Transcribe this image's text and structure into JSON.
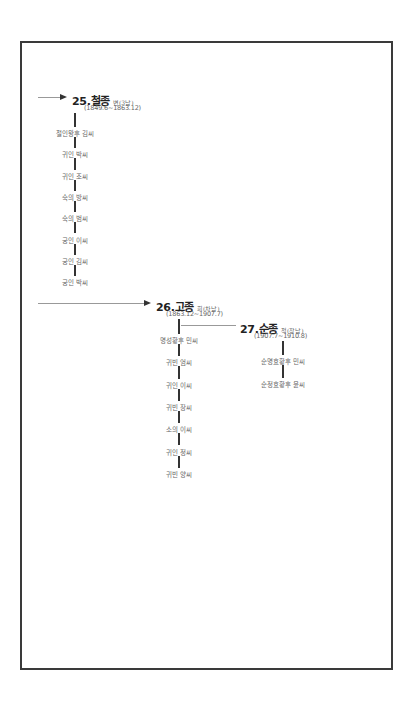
{
  "diagram": {
    "type": "royal-family-tree",
    "kings": [
      {
        "number_name": "25.철종",
        "sub": "변(3남)",
        "reign": "(1849.6~1863.12)",
        "spouses": [
          "철인왕후 김씨",
          "귀인 박씨",
          "귀인 조씨",
          "숙의 방씨",
          "숙의 범씨",
          "궁인 이씨",
          "궁인 김씨",
          "궁인 박씨"
        ]
      },
      {
        "number_name": "26.고종",
        "sub": "희(차남)",
        "reign": "(1863.12~1907.7)",
        "spouses": [
          "명성황후 민씨",
          "귀빈 엄씨",
          "귀인 이씨",
          "귀빈 장씨",
          "소의 이씨",
          "귀인 정씨",
          "귀빈 양씨"
        ]
      },
      {
        "number_name": "27.순종",
        "sub": "척(장남)",
        "reign": "(1907.7~1910.8)",
        "spouses": [
          "순명효황후 민씨",
          "순정효황후 윤씨"
        ]
      }
    ],
    "colors": {
      "frame": "#3a3a3a",
      "connector": "#333333",
      "arrow_line": "#999999",
      "text": "#666666"
    }
  }
}
